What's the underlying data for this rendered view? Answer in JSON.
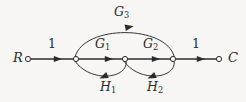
{
  "figure": {
    "kind": "signal-flow-graph",
    "width": 246,
    "height": 102,
    "background_color": "#f7f6f4",
    "ink_color": "#2b2b2b"
  },
  "nodes": [
    {
      "id": "R",
      "label": "R",
      "x": 28,
      "y": 59,
      "radius": 2.6,
      "label_x": 13,
      "label_y": 52,
      "terminal": true
    },
    {
      "id": "n1",
      "label": "",
      "x": 76,
      "y": 59,
      "radius": 2.6,
      "terminal": false
    },
    {
      "id": "n2",
      "label": "",
      "x": 125,
      "y": 59,
      "radius": 2.6,
      "terminal": false
    },
    {
      "id": "n3",
      "label": "",
      "x": 173,
      "y": 59,
      "radius": 2.6,
      "terminal": false
    },
    {
      "id": "C",
      "label": "C",
      "x": 219,
      "y": 59,
      "radius": 2.6,
      "label_x": 228,
      "label_y": 52,
      "terminal": true
    }
  ],
  "edges": [
    {
      "id": "e-r-n1",
      "from": "R",
      "to": "n1",
      "gain_base": "1",
      "gain_sub": "",
      "label_x": 48,
      "label_y": 38,
      "shape": "straight",
      "direction": "forward"
    },
    {
      "id": "e-n1-n2",
      "from": "n1",
      "to": "n2",
      "gain_base": "G",
      "gain_sub": "1",
      "label_x": 95,
      "label_y": 38,
      "shape": "straight",
      "direction": "forward"
    },
    {
      "id": "e-n2-n3",
      "from": "n2",
      "to": "n3",
      "gain_base": "G",
      "gain_sub": "2",
      "label_x": 143,
      "label_y": 38,
      "shape": "straight",
      "direction": "forward"
    },
    {
      "id": "e-n3-c",
      "from": "n3",
      "to": "C",
      "gain_base": "1",
      "gain_sub": "",
      "label_x": 192,
      "label_y": 38,
      "shape": "straight",
      "direction": "forward"
    },
    {
      "id": "e-n1-n3",
      "from": "n1",
      "to": "n3",
      "gain_base": "G",
      "gain_sub": "3",
      "label_x": 114,
      "label_y": 6,
      "shape": "arc-above",
      "direction": "forward"
    },
    {
      "id": "e-n2-n1",
      "from": "n2",
      "to": "n1",
      "gain_base": "H",
      "gain_sub": "1",
      "label_x": 100,
      "label_y": 81,
      "shape": "arc-below",
      "direction": "feedback"
    },
    {
      "id": "e-n3-n2",
      "from": "n3",
      "to": "n2",
      "gain_base": "H",
      "gain_sub": "2",
      "label_x": 147,
      "label_y": 81,
      "shape": "arc-below",
      "direction": "feedback"
    }
  ],
  "geometry": {
    "baseline_y": 59,
    "arrow_half_width": 3.1,
    "arrow_length": 8.2,
    "stroke_width_straight": 1.5,
    "stroke_width_arc": 0.95,
    "node_stroke_width": 1.0,
    "node_fill": "#f7f6f4",
    "top_arc_apex_y": 28,
    "bottom_arc_apex_y": 79
  },
  "icons": {
    "node": "open-circle-node-icon",
    "arrowhead": "filled-triangle-arrowhead-icon"
  }
}
